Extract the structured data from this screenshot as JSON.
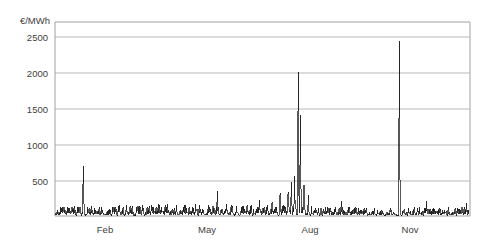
{
  "chart_data": {
    "type": "line",
    "title": "",
    "subtitle": "",
    "xlabel": "",
    "ylabel": "€/MWh",
    "ylim": [
      0,
      2700
    ],
    "xlim": [
      0,
      365
    ],
    "grid": true,
    "legend": null,
    "y_ticks": [
      500,
      1000,
      1500,
      2000,
      2500
    ],
    "y_tick_labels": [
      "500",
      "1000",
      "1500",
      "2000",
      "2500"
    ],
    "x_ticks": [
      31,
      120,
      212,
      304
    ],
    "x_tick_labels": [
      "Feb",
      "May",
      "Aug",
      "Nov"
    ],
    "series": [
      {
        "name": "Electricity spot price",
        "color": "#101010",
        "units": "€/MWh",
        "notes": "Daily/hourly spot price over one calendar year; dense noise band 0-150 with isolated extreme spikes",
        "baseline_mean": 60,
        "baseline_noise_range": [
          10,
          150
        ],
        "spikes": [
          {
            "x": 25,
            "value": 690,
            "label": "January spike"
          },
          {
            "x": 205,
            "value": 330,
            "label": "late July cluster"
          },
          {
            "x": 208,
            "value": 480,
            "label": "late July cluster"
          },
          {
            "x": 211,
            "value": 560,
            "label": "late July cluster"
          },
          {
            "x": 214,
            "value": 2000,
            "label": "annual maximum cluster"
          },
          {
            "x": 216,
            "value": 1400,
            "label": "secondary August spike"
          },
          {
            "x": 219,
            "value": 430,
            "label": "August cluster tail"
          },
          {
            "x": 303,
            "value": 2430,
            "label": "November maximum"
          }
        ],
        "max_value": 2430,
        "min_value": 8
      }
    ]
  },
  "axes": {
    "y_axis_title": "€/MWh",
    "y_ticks": [
      {
        "label": "2500"
      },
      {
        "label": "2000"
      },
      {
        "label": "1500"
      },
      {
        "label": "1000"
      },
      {
        "label": "500"
      }
    ],
    "x_ticks": [
      {
        "label": "Feb"
      },
      {
        "label": "May"
      },
      {
        "label": "Aug"
      },
      {
        "label": "Nov"
      }
    ]
  },
  "colors": {
    "series": "#101010",
    "grid": "#b8b8b8",
    "frame": "#a0a0a0",
    "text": "#404040",
    "background": "#ffffff"
  }
}
